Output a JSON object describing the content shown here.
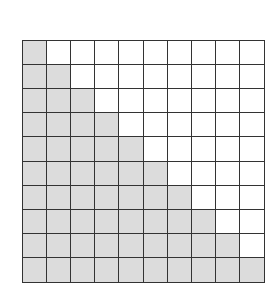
{
  "diagram": {
    "type": "grid",
    "rows": 10,
    "cols": 10,
    "shaded_per_row": [
      1,
      2,
      3,
      4,
      5,
      6,
      7,
      8,
      9,
      10
    ],
    "total_shaded": 55,
    "total_cells": 100,
    "colors": {
      "shaded": "#dcdcdc",
      "empty": "#ffffff",
      "line": "#333333"
    }
  }
}
